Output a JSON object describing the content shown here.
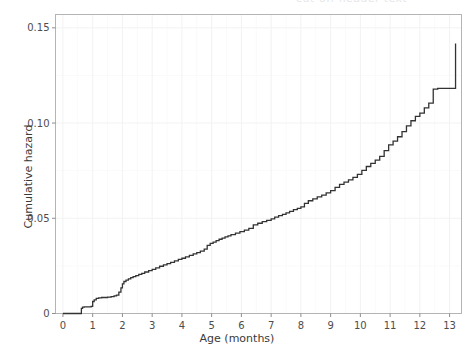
{
  "chart_data": {
    "type": "line",
    "title": "",
    "subtitle": "",
    "xlabel": "Age (months)",
    "ylabel": "Cumulative hazard",
    "xlim": [
      -0.25,
      13.4
    ],
    "ylim": [
      0,
      0.157
    ],
    "xticks": [
      0,
      1,
      2,
      3,
      4,
      5,
      6,
      7,
      8,
      9,
      10,
      11,
      12,
      13
    ],
    "xticklabels": [
      "0",
      "1",
      "2",
      "3",
      "4",
      "5",
      "6",
      "7",
      "8",
      "9",
      "10",
      "11",
      "12",
      "13"
    ],
    "yticks": [
      0,
      0.05,
      0.1,
      0.15
    ],
    "yticklabels": [
      "0",
      "0.05",
      "0.10",
      "0.15"
    ],
    "grid": true,
    "grid_color": "#f2f2f2",
    "panel_border_color": "#b4b4b4",
    "line_color": "#333333",
    "line_width": 1.3,
    "legend": null,
    "annotations": [],
    "series": [
      {
        "name": "Cumulative hazard",
        "step": "post",
        "x": [
          0.0,
          0.45,
          0.62,
          0.66,
          0.72,
          0.95,
          1.0,
          1.05,
          1.12,
          1.2,
          1.3,
          1.5,
          1.62,
          1.72,
          1.8,
          1.88,
          1.95,
          2.0,
          2.05,
          2.12,
          2.2,
          2.28,
          2.36,
          2.45,
          2.55,
          2.65,
          2.75,
          2.88,
          3.0,
          3.12,
          3.25,
          3.38,
          3.5,
          3.62,
          3.75,
          3.88,
          4.0,
          4.12,
          4.25,
          4.38,
          4.5,
          4.62,
          4.75,
          4.85,
          4.95,
          5.05,
          5.15,
          5.25,
          5.35,
          5.45,
          5.55,
          5.65,
          5.8,
          5.95,
          6.1,
          6.25,
          6.4,
          6.55,
          6.7,
          6.85,
          7.0,
          7.12,
          7.25,
          7.38,
          7.5,
          7.62,
          7.75,
          7.88,
          8.0,
          8.12,
          8.25,
          8.4,
          8.55,
          8.7,
          8.85,
          9.0,
          9.15,
          9.3,
          9.45,
          9.6,
          9.75,
          9.9,
          10.05,
          10.2,
          10.35,
          10.5,
          10.65,
          10.8,
          10.95,
          11.1,
          11.25,
          11.4,
          11.55,
          11.7,
          11.85,
          12.0,
          12.15,
          12.3,
          12.45,
          12.6,
          13.2
        ],
        "y": [
          0.0,
          0.0,
          0.0027,
          0.0033,
          0.0035,
          0.0037,
          0.0063,
          0.0072,
          0.0079,
          0.0082,
          0.0084,
          0.0086,
          0.0089,
          0.0093,
          0.0097,
          0.0112,
          0.0135,
          0.0156,
          0.0168,
          0.0175,
          0.0182,
          0.0188,
          0.0194,
          0.0199,
          0.0205,
          0.0211,
          0.0218,
          0.0225,
          0.0232,
          0.024,
          0.0248,
          0.0255,
          0.0262,
          0.0268,
          0.0276,
          0.0284,
          0.029,
          0.0297,
          0.0305,
          0.0313,
          0.032,
          0.0328,
          0.0338,
          0.0358,
          0.0368,
          0.0375,
          0.0383,
          0.039,
          0.0396,
          0.0402,
          0.0408,
          0.0414,
          0.0422,
          0.043,
          0.0438,
          0.0447,
          0.0465,
          0.0474,
          0.0482,
          0.0489,
          0.0497,
          0.0506,
          0.0514,
          0.0521,
          0.0528,
          0.0536,
          0.0545,
          0.0552,
          0.056,
          0.0578,
          0.0592,
          0.0602,
          0.0612,
          0.0622,
          0.0633,
          0.0645,
          0.0662,
          0.0678,
          0.069,
          0.0702,
          0.0715,
          0.073,
          0.0752,
          0.0772,
          0.0788,
          0.0805,
          0.0825,
          0.0855,
          0.0885,
          0.0905,
          0.0928,
          0.0955,
          0.0985,
          0.1012,
          0.1035,
          0.1052,
          0.108,
          0.1105,
          0.1178,
          0.1182,
          0.1418
        ]
      }
    ]
  },
  "figure": {
    "top_clipped_text": "cut-off header text",
    "background_color": "#ffffff"
  }
}
